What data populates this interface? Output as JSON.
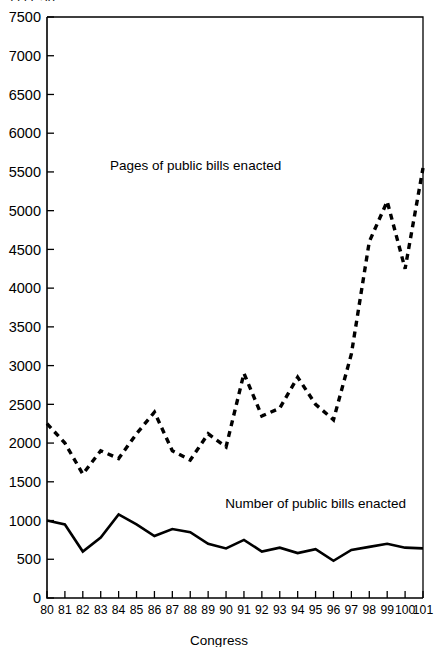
{
  "figure": {
    "clipped_top_caption": "1111  50",
    "background_color": "#ffffff",
    "ink_color": "#000000"
  },
  "chart_data": {
    "type": "line",
    "title": "",
    "subtitle": "",
    "xlabel": "Congress",
    "ylabel": "",
    "xlim": [
      80,
      101
    ],
    "ylim": [
      0,
      7500
    ],
    "grid": false,
    "legend_position": "inline-annotation",
    "x": [
      80,
      81,
      82,
      83,
      84,
      85,
      86,
      87,
      88,
      89,
      90,
      91,
      92,
      93,
      94,
      95,
      96,
      97,
      98,
      99,
      100,
      101
    ],
    "xtick_labels": [
      "80",
      "81",
      "82",
      "83",
      "84",
      "85",
      "86",
      "87",
      "88",
      "89",
      "90",
      "91",
      "92",
      "93",
      "94",
      "95",
      "96",
      "97",
      "98",
      "99",
      "100",
      "101"
    ],
    "ytick_labels": [
      "0",
      "500",
      "1000",
      "1500",
      "2000",
      "2500",
      "3000",
      "3500",
      "4000",
      "4500",
      "5000",
      "5500",
      "6000",
      "6500",
      "7000",
      "7500"
    ],
    "ytick_values": [
      0,
      500,
      1000,
      1500,
      2000,
      2500,
      3000,
      3500,
      4000,
      4500,
      5000,
      5500,
      6000,
      6500,
      7000,
      7500
    ],
    "series": [
      {
        "name": "Pages of public bills enacted",
        "style": "dashed",
        "label_text": "Pages of public bills enacted",
        "values": [
          2250,
          2000,
          1600,
          1900,
          1800,
          2120,
          2400,
          1900,
          1780,
          2120,
          1950,
          2900,
          2350,
          2450,
          2850,
          2500,
          2300,
          3150,
          4600,
          5120,
          4250,
          5550
        ]
      },
      {
        "name": "Number of public bills enacted",
        "style": "solid",
        "label_text": "Number of public bills enacted",
        "values": [
          1000,
          950,
          600,
          780,
          1080,
          950,
          800,
          890,
          850,
          700,
          640,
          750,
          600,
          650,
          580,
          630,
          480,
          620,
          660,
          700,
          650,
          640
        ]
      }
    ],
    "annotations": [
      {
        "text": "Pages of public bills enacted",
        "x": 88.3,
        "y": 5530
      },
      {
        "text": "Number of public bills enacted",
        "x": 95.0,
        "y": 1160
      }
    ]
  }
}
